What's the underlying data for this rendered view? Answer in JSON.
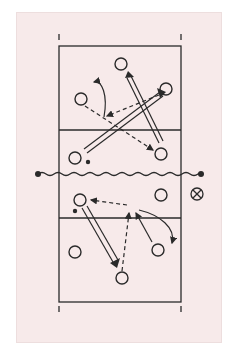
{
  "diagram": {
    "type": "volleyball-court-play",
    "colors": {
      "background": "#f7eaea",
      "ink": "#2a2a2a"
    },
    "court": {
      "left": 59,
      "right": 181,
      "top": 46,
      "bottom": 302,
      "net_y": 174,
      "attack_line_top": 130,
      "attack_line_bottom": 218
    },
    "legend_symbol": {
      "name": "crossed-circle",
      "x": 197,
      "y": 194
    },
    "top_players": [
      {
        "x": 121,
        "y": 64
      },
      {
        "x": 166,
        "y": 89
      },
      {
        "x": 81,
        "y": 99
      },
      {
        "x": 75,
        "y": 158
      },
      {
        "x": 161,
        "y": 154
      }
    ],
    "bottom_players": [
      {
        "x": 80,
        "y": 200
      },
      {
        "x": 161,
        "y": 195
      },
      {
        "x": 75,
        "y": 252
      },
      {
        "x": 122,
        "y": 278
      },
      {
        "x": 158,
        "y": 250
      }
    ]
  }
}
